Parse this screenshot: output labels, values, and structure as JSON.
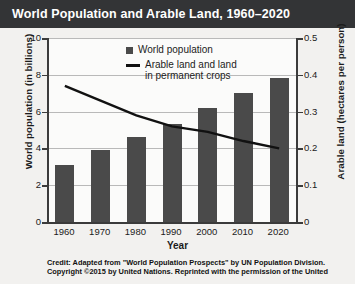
{
  "title": "World Population and Arable Land, 1960–2020",
  "legend": {
    "bar_label": "World population",
    "line_label_line1": "Arable land and land",
    "line_label_line2": "in permanent crops"
  },
  "credit": {
    "label": "Credit:",
    "line1": "Adapted from \"World Population Prospects\" by UN Population Division.",
    "line2": "Copyright ©2015 by United Nations. Reprinted with the permission of the United"
  },
  "axes": {
    "left_title": "World population (in billions)",
    "right_title": "Arable land (hectares per person)",
    "x_title": "Year",
    "left_ticks": [
      "0",
      "2",
      "4",
      "6",
      "8",
      "10"
    ],
    "right_ticks": [
      "0",
      "0.1",
      "0.2",
      "0.3",
      "0.4",
      "0.5"
    ]
  },
  "chart_data": {
    "type": "bar",
    "title": "World Population and Arable Land, 1960–2020",
    "xlabel": "Year",
    "ylabel": "World population (in billions)",
    "y2label": "Arable land (hectares per person)",
    "categories": [
      "1960",
      "1970",
      "1980",
      "1990",
      "2000",
      "2010",
      "2020"
    ],
    "ylim": [
      0,
      10
    ],
    "y2lim": [
      0,
      0.5
    ],
    "grid": true,
    "legend_position": "top-center",
    "series": [
      {
        "name": "World population",
        "type": "bar",
        "axis": "left",
        "unit": "billions",
        "color": "#4a4a4a",
        "values": [
          3.1,
          3.9,
          4.6,
          5.3,
          6.2,
          7.0,
          7.8
        ]
      },
      {
        "name": "Arable land and land in permanent crops",
        "type": "line",
        "axis": "right",
        "unit": "hectares per person",
        "color": "#111111",
        "values": [
          0.37,
          0.33,
          0.29,
          0.26,
          0.245,
          0.22,
          0.2
        ]
      }
    ]
  }
}
